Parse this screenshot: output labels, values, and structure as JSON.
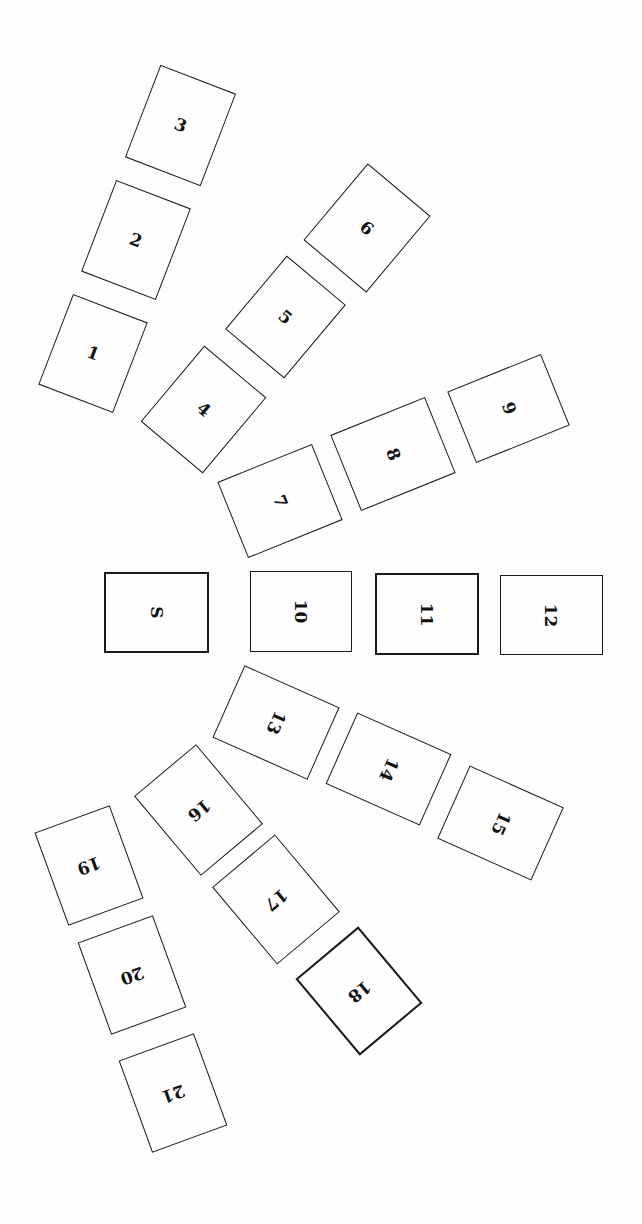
{
  "diagram": {
    "type": "seating-layout",
    "colors": {
      "background": "#fdfdfc",
      "outline": "#1a1a1a",
      "text": "#111111"
    },
    "cards": [
      {
        "id": "1",
        "label": "1",
        "cx": 93,
        "cy": 353,
        "w": 80,
        "h": 97,
        "rot": 21,
        "text_rot": 21,
        "heavy": false
      },
      {
        "id": "2",
        "label": "2",
        "cx": 136,
        "cy": 240,
        "w": 80,
        "h": 98,
        "rot": 21,
        "text_rot": 21,
        "heavy": false
      },
      {
        "id": "3",
        "label": "3",
        "cx": 180,
        "cy": 125,
        "w": 81,
        "h": 99,
        "rot": 21,
        "text_rot": 21,
        "heavy": false
      },
      {
        "id": "4",
        "label": "4",
        "cx": 203,
        "cy": 409,
        "w": 81,
        "h": 99,
        "rot": 40,
        "text_rot": 40,
        "heavy": false
      },
      {
        "id": "5",
        "label": "5",
        "cx": 285,
        "cy": 317,
        "w": 77,
        "h": 96,
        "rot": 40,
        "text_rot": 40,
        "heavy": false
      },
      {
        "id": "6",
        "label": "6",
        "cx": 367,
        "cy": 228,
        "w": 82,
        "h": 100,
        "rot": 40,
        "text_rot": 40,
        "heavy": false
      },
      {
        "id": "7",
        "label": "7",
        "cx": 280,
        "cy": 501,
        "w": 102,
        "h": 82,
        "rot": -22,
        "text_rot": 68,
        "heavy": false
      },
      {
        "id": "8",
        "label": "8",
        "cx": 393,
        "cy": 454,
        "w": 102,
        "h": 82,
        "rot": -22,
        "text_rot": 68,
        "heavy": false
      },
      {
        "id": "9",
        "label": "9",
        "cx": 508,
        "cy": 408,
        "w": 101,
        "h": 77,
        "rot": -22,
        "text_rot": 68,
        "heavy": false
      },
      {
        "id": "S",
        "label": "S",
        "cx": 156,
        "cy": 612,
        "w": 105,
        "h": 81,
        "rot": 0,
        "text_rot": 90,
        "heavy": true
      },
      {
        "id": "10",
        "label": "10",
        "cx": 301,
        "cy": 611,
        "w": 102,
        "h": 81,
        "rot": 0,
        "text_rot": 90,
        "heavy": false
      },
      {
        "id": "11",
        "label": "11",
        "cx": 427,
        "cy": 614,
        "w": 104,
        "h": 82,
        "rot": 0,
        "text_rot": 90,
        "heavy": true
      },
      {
        "id": "12",
        "label": "12",
        "cx": 551,
        "cy": 615,
        "w": 103,
        "h": 80,
        "rot": 0,
        "text_rot": 90,
        "heavy": false
      },
      {
        "id": "13",
        "label": "13",
        "cx": 276,
        "cy": 722,
        "w": 104,
        "h": 79,
        "rot": 24,
        "text_rot": 114,
        "heavy": false
      },
      {
        "id": "14",
        "label": "14",
        "cx": 388,
        "cy": 769,
        "w": 103,
        "h": 78,
        "rot": 24,
        "text_rot": 114,
        "heavy": false
      },
      {
        "id": "15",
        "label": "15",
        "cx": 500,
        "cy": 823,
        "w": 103,
        "h": 80,
        "rot": 24,
        "text_rot": 114,
        "heavy": false
      },
      {
        "id": "16",
        "label": "16",
        "cx": 198,
        "cy": 810,
        "w": 81,
        "h": 104,
        "rot": -40,
        "text_rot": 140,
        "heavy": false
      },
      {
        "id": "17",
        "label": "17",
        "cx": 276,
        "cy": 899,
        "w": 82,
        "h": 101,
        "rot": -40,
        "text_rot": 140,
        "heavy": false
      },
      {
        "id": "18",
        "label": "18",
        "cx": 359,
        "cy": 991,
        "w": 82,
        "h": 100,
        "rot": -40,
        "text_rot": 140,
        "heavy": true
      },
      {
        "id": "19",
        "label": "19",
        "cx": 89,
        "cy": 865,
        "w": 80,
        "h": 99,
        "rot": -20,
        "text_rot": 160,
        "heavy": false
      },
      {
        "id": "20",
        "label": "20",
        "cx": 132,
        "cy": 975,
        "w": 80,
        "h": 98,
        "rot": -20,
        "text_rot": 160,
        "heavy": false
      },
      {
        "id": "21",
        "label": "21",
        "cx": 173,
        "cy": 1093,
        "w": 80,
        "h": 98,
        "rot": -20,
        "text_rot": 160,
        "heavy": false
      }
    ]
  }
}
